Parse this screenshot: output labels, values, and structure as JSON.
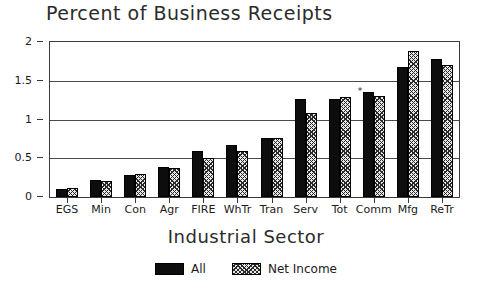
{
  "chart_data": {
    "type": "bar",
    "title": "Percent of Business Receipts",
    "xlabel": "Industrial Sector",
    "ylabel": "",
    "categories": [
      "EGS",
      "Min",
      "Con",
      "Agr",
      "FIRE",
      "WhTr",
      "Tran",
      "Serv",
      "Tot",
      "Comm",
      "Mfg",
      "ReTr"
    ],
    "series": [
      {
        "name": "All",
        "values": [
          0.1,
          0.22,
          0.29,
          0.39,
          0.59,
          0.67,
          0.76,
          1.26,
          1.27,
          1.35,
          1.68,
          1.78
        ]
      },
      {
        "name": "Net Income",
        "values": [
          0.12,
          0.21,
          0.3,
          0.38,
          0.5,
          0.6,
          0.76,
          1.08,
          1.29,
          1.3,
          1.88,
          1.7
        ]
      }
    ],
    "ylim": [
      0,
      2
    ],
    "yticks": [
      0,
      0.5,
      1,
      1.5,
      2
    ],
    "ytick_labels": [
      "0",
      "0.5",
      "1",
      "1.5",
      "2"
    ],
    "grid": true,
    "legend_position": "bottom",
    "annotations": [
      {
        "text": "*",
        "category": "Comm",
        "series": "All"
      }
    ]
  },
  "legend": {
    "items": [
      {
        "label": "All",
        "pattern": "solid-black",
        "color": "#0d0d0d"
      },
      {
        "label": "Net Income",
        "pattern": "hatched-gray",
        "color": "#8c8c8c"
      }
    ]
  },
  "colors": {
    "axis": "#3a3a3a",
    "grid": "#4a4a4a",
    "text": "#1a1a1a",
    "title": "#2b2b2b",
    "background": "#ffffff"
  }
}
